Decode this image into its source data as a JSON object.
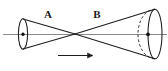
{
  "figure": {
    "background_color": "#ffffff",
    "stroke_color": "#1d1d1d",
    "axis_color": "#8a8a8a",
    "labels": [
      {
        "id": "label-a",
        "text": "A",
        "x": 48,
        "y": 18,
        "describes": "left cone"
      },
      {
        "id": "label-b",
        "text": "B",
        "x": 97,
        "y": 18,
        "describes": "right cone"
      }
    ],
    "axis": {
      "name": "horizontal-axis-line",
      "x1": 3,
      "x2": 167,
      "y": 34
    },
    "apex": {
      "x": 75,
      "y": 34
    },
    "cone_a": {
      "name": "left-cone",
      "base_center_x": 23,
      "base_center_y": 34,
      "base_rx": 4.5,
      "base_ry": 15,
      "center_dot": {
        "x": 23,
        "y": 34,
        "r": 1.6
      }
    },
    "cone_b": {
      "name": "right-cone",
      "base_center_x": 155,
      "base_center_y": 34,
      "base_rx": 7,
      "base_ry": 25,
      "hidden_arc_x": 140,
      "hidden_arc_rx": 7,
      "hidden_arc_ry": 25,
      "center_dot": {
        "x": 148,
        "y": 34,
        "r": 1.8
      }
    },
    "arrow": {
      "name": "direction-arrow",
      "x1": 58,
      "x2": 93,
      "y": 55,
      "direction": "right"
    }
  }
}
